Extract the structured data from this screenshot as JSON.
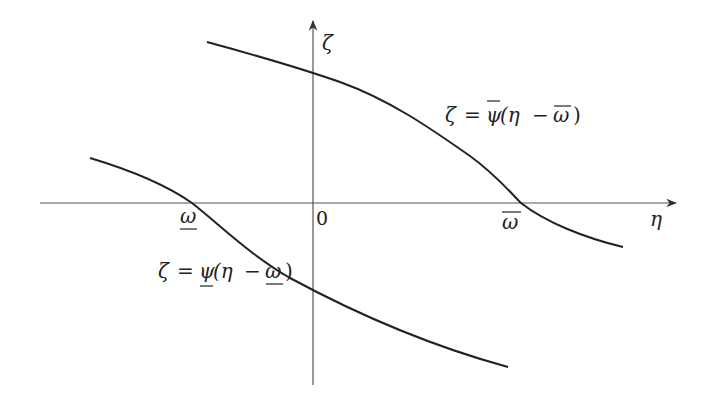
{
  "diagram": {
    "axes": {
      "horizontal_label": "η",
      "vertical_label": "ζ",
      "origin_label": "0"
    },
    "points": {
      "lower_crossing_label": "ω",
      "upper_crossing_label": "ω"
    },
    "curves": {
      "upper": {
        "lhs": "ζ",
        "eq": "=",
        "func": "ψ",
        "arg_open": "(η",
        "minus": "−",
        "arg_omega": "ω",
        "arg_close": ")",
        "decoration": "overline"
      },
      "lower": {
        "lhs": "ζ",
        "eq": "=",
        "func": "ψ",
        "arg_open": "(η",
        "minus": "−",
        "arg_omega": "ω",
        "arg_close": ")",
        "decoration": "underline"
      }
    },
    "colors": {
      "curve": "#222222",
      "axis": "#555555"
    }
  }
}
